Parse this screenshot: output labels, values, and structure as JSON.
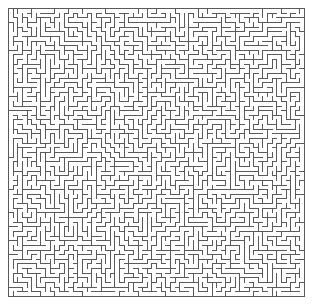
{
  "figure": {
    "kind": "maze",
    "width": 313,
    "height": 304,
    "background_color": "#ffffff"
  },
  "maze": {
    "origin_x": 8,
    "origin_y": 8,
    "pixel_width": 296,
    "pixel_height": 288,
    "columns": 64,
    "rows": 62,
    "cell_pitch_x": 4.625,
    "cell_pitch_y": 4.645,
    "wall_color": "#5a5a5a",
    "wall_thickness": 1,
    "passage_color": "#ffffff",
    "border_closed": true,
    "border_top": true,
    "border_right": true,
    "border_bottom": true,
    "border_left": true,
    "algorithm": "recursive-backtracker",
    "seed": 20240517,
    "perfect": true,
    "entrance": null,
    "exit": null,
    "solution_shown": false,
    "labels": []
  }
}
